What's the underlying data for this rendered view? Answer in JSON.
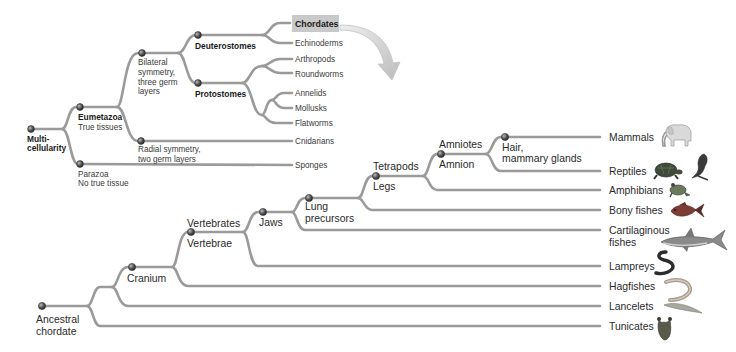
{
  "top_tree": {
    "root": {
      "label_lines": [
        "Multi-",
        "cellularity"
      ]
    },
    "eumetazoa": {
      "label_lines": [
        "Eumetazoa",
        "True tissues"
      ]
    },
    "parazoa": {
      "label_lines": [
        "Parazoa",
        "No true tissue"
      ]
    },
    "bilateral": {
      "label_lines": [
        "Bilateral",
        "symmetry,",
        "three germ",
        "layers"
      ]
    },
    "radial": {
      "label_lines": [
        "Radial symmetry,",
        "two germ layers"
      ]
    },
    "deuterostomes": {
      "label": "Deuterostomes"
    },
    "protostomes": {
      "label": "Protostomes"
    },
    "taxa": [
      {
        "label": "Chordates",
        "highlighted": true
      },
      {
        "label": "Echinoderms"
      },
      {
        "label": "Arthropods"
      },
      {
        "label": "Roundworms"
      },
      {
        "label": "Annelids"
      },
      {
        "label": "Mollusks"
      },
      {
        "label": "Flatworms"
      },
      {
        "label": "Cnidarians"
      },
      {
        "label": "Sponges"
      }
    ]
  },
  "bottom_tree": {
    "root": {
      "label_lines": [
        "Ancestral",
        "chordate"
      ]
    },
    "cranium": {
      "label": "Cranium"
    },
    "vertebrates": {
      "label_lines": [
        "Vertebrates",
        "Vertebrae"
      ]
    },
    "jaws": {
      "label": "Jaws"
    },
    "lung": {
      "label_lines": [
        "Lung",
        "precursors"
      ]
    },
    "tetrapods": {
      "label_lines": [
        "Tetrapods",
        "Legs"
      ]
    },
    "amniotes": {
      "label_lines": [
        "Amniotes",
        "Amnion"
      ]
    },
    "hair": {
      "label_lines": [
        "Hair,",
        "mammary glands"
      ]
    },
    "taxa": [
      {
        "label": "Mammals",
        "icon": "elephant"
      },
      {
        "label": "Reptiles",
        "icon": "turtle-and-lizard"
      },
      {
        "label": "Amphibians",
        "icon": "frog"
      },
      {
        "label": "Bony fishes",
        "icon": "bony-fish"
      },
      {
        "label_lines": [
          "Cartilaginous",
          "fishes"
        ],
        "icon": "shark"
      },
      {
        "label": "Lampreys",
        "icon": "lamprey"
      },
      {
        "label": "Hagfishes",
        "icon": "hagfish"
      },
      {
        "label": "Lancelets",
        "icon": "lancelet"
      },
      {
        "label": "Tunicates",
        "icon": "tunicate"
      }
    ]
  },
  "colors": {
    "branch": "#9a9a9a",
    "highlight_box": "#c9c9c9",
    "arrow": "#d0d0d0",
    "node": "#444444"
  }
}
